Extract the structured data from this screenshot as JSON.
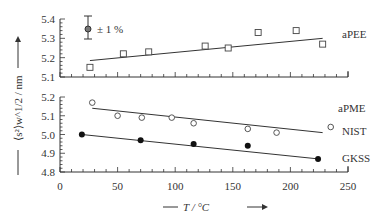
{
  "chart_data": [
    {
      "type": "scatter",
      "panel": "upper",
      "title": "",
      "xlabel": "T / °C",
      "ylabel": "⟨s²⟩w^1/2 / nm",
      "xlim": [
        0,
        250
      ],
      "ylim": [
        5.1,
        5.4
      ],
      "yticks": [
        "5.1",
        "5.2",
        "5.3",
        "5.4"
      ],
      "annotation": "± 1 %",
      "series": [
        {
          "name": "aPEE",
          "marker": "open-square",
          "x": [
            26,
            55,
            77,
            126,
            146,
            172,
            205,
            228
          ],
          "y": [
            5.15,
            5.22,
            5.23,
            5.26,
            5.25,
            5.33,
            5.34,
            5.27
          ],
          "fit_line": {
            "x": [
              26,
              228
            ],
            "y": [
              5.185,
              5.3
            ]
          }
        }
      ]
    },
    {
      "type": "scatter",
      "panel": "lower",
      "title": "",
      "xlabel": "T / °C",
      "ylabel": "⟨s²⟩w^1/2 / nm",
      "xlim": [
        0,
        250
      ],
      "ylim": [
        4.8,
        5.2
      ],
      "yticks": [
        "4.8",
        "4.9",
        "5.0",
        "5.1",
        "5.2"
      ],
      "xticks": [
        "0",
        "50",
        "100",
        "150",
        "200",
        "250"
      ],
      "series": [
        {
          "name": "aPME NIST",
          "marker": "open-circle",
          "x": [
            28,
            50,
            71,
            97,
            116,
            163,
            188,
            235
          ],
          "y": [
            5.17,
            5.1,
            5.09,
            5.09,
            5.06,
            5.03,
            5.01,
            5.04
          ],
          "fit_line": {
            "x": [
              28,
              228
            ],
            "y": [
              5.14,
              5.01
            ]
          }
        },
        {
          "name": "aPME GKSS",
          "marker": "filled-circle",
          "x": [
            19,
            70,
            116,
            163,
            224
          ],
          "y": [
            5.0,
            4.97,
            4.95,
            4.94,
            4.87
          ],
          "fit_line": {
            "x": [
              19,
              224
            ],
            "y": [
              5.0,
              4.87
            ]
          }
        }
      ]
    }
  ],
  "labels": {
    "upper_yticks": [
      "5.4",
      "5.3",
      "5.2",
      "5.1"
    ],
    "lower_yticks": [
      "5.2",
      "5.1",
      "5.0",
      "4.9",
      "4.8"
    ],
    "xticks": [
      "0",
      "50",
      "100",
      "150",
      "200",
      "250"
    ],
    "xlabel": "T / °C",
    "ylabel": "⟨s²⟩w^1/2 / nm",
    "error_annotation": "± 1 %",
    "aPEE": "aPEE",
    "aPME": "aPME",
    "NIST": "NIST",
    "GKSS": "GKSS"
  }
}
